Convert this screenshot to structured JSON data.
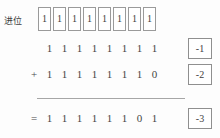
{
  "figure": {
    "title_label": "进位",
    "accent_color": "#9a9a9a",
    "text_color": "#444444",
    "background_color": "#fdfdfd"
  },
  "carry_row": {
    "label": "进位",
    "bits": [
      "1",
      "1",
      "1",
      "1",
      "1",
      "1",
      "1",
      "1"
    ]
  },
  "rows": [
    {
      "operator": "",
      "bits": [
        "1",
        "1",
        "1",
        "1",
        "1",
        "1",
        "1",
        "1"
      ],
      "value": "-1"
    },
    {
      "operator": "+",
      "bits": [
        "1",
        "1",
        "1",
        "1",
        "1",
        "1",
        "1",
        "0"
      ],
      "value": "-2"
    },
    {
      "operator": "=",
      "bits": [
        "1",
        "1",
        "1",
        "1",
        "1",
        "1",
        "0",
        "1"
      ],
      "value": "-3"
    }
  ],
  "chart_data": {
    "type": "table",
    "title": "",
    "categories": [
      "carry",
      "addend1",
      "addend2",
      "sum"
    ],
    "rows": [
      {
        "name": "carry",
        "operator": "",
        "binary": "11111111",
        "decimal": null
      },
      {
        "name": "addend1",
        "operator": "",
        "binary": "11111111",
        "decimal": -1
      },
      {
        "name": "addend2",
        "operator": "+",
        "binary": "11111110",
        "decimal": -2
      },
      {
        "name": "sum",
        "operator": "=",
        "binary": "11111101",
        "decimal": -3
      }
    ]
  }
}
